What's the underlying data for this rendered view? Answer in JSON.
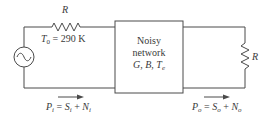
{
  "diagram": {
    "type": "circuit",
    "source": {
      "icon": "ac-source-icon"
    },
    "input_resistor": {
      "label": "R",
      "temperature_label": {
        "symbol": "T",
        "sub": "0",
        "rest": " = 290 K"
      }
    },
    "network_box": {
      "line1": "Noisy",
      "line2": "network",
      "params": [
        {
          "symbol": "G",
          "sub": ""
        },
        {
          "symbol": "B",
          "sub": ""
        },
        {
          "symbol": "T",
          "sub": "e"
        }
      ],
      "sep": ", "
    },
    "load_resistor": {
      "label": "R"
    },
    "input_power": {
      "P": "P",
      "P_sub": "i",
      "eq": " = ",
      "S": "S",
      "S_sub": "i",
      "plus": " + ",
      "N": "N",
      "N_sub": "i"
    },
    "output_power": {
      "P": "P",
      "P_sub": "o",
      "eq": " = ",
      "S": "S",
      "S_sub": "o",
      "plus": " + ",
      "N": "N",
      "N_sub": "o"
    },
    "colors": {
      "line": "#4a4a4a",
      "text": "#3a3a3a",
      "background": "#ffffff"
    }
  }
}
